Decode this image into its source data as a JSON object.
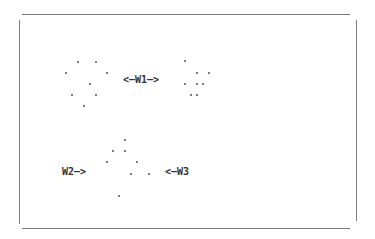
{
  "diagram": {
    "labels": {
      "w1": "<—W1—>",
      "w2": "W2—>",
      "w3": "<—W3"
    },
    "clusters": {
      "left": [
        [
          78,
          62
        ],
        [
          96,
          62
        ],
        [
          66,
          73
        ],
        [
          107,
          73
        ],
        [
          90,
          84
        ],
        [
          72,
          95
        ],
        [
          96,
          95
        ],
        [
          84,
          106
        ]
      ],
      "right": [
        [
          185,
          61
        ],
        [
          197,
          73
        ],
        [
          209,
          73
        ],
        [
          185,
          84
        ],
        [
          197,
          84
        ],
        [
          203,
          84
        ],
        [
          191,
          95
        ],
        [
          197,
          95
        ]
      ],
      "middle": [
        [
          125,
          140
        ],
        [
          113,
          151
        ],
        [
          125,
          151
        ],
        [
          107,
          162
        ],
        [
          137,
          162
        ],
        [
          131,
          174
        ],
        [
          149,
          174
        ],
        [
          119,
          196
        ]
      ]
    },
    "colors": {
      "frame": "#7a7a7a",
      "dot": "#555555",
      "text": "#333333"
    }
  }
}
